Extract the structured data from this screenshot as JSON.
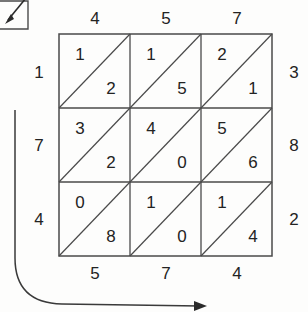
{
  "figure": {
    "type": "lattice-multiplication-grid",
    "rows": 3,
    "cols": 3,
    "diagonal_direction": "bottom-left-to-top-right",
    "line_color": "#4a4a4a",
    "text_color": "#232323",
    "background_color": "#fdfdfc"
  },
  "labels": {
    "top": [
      "4",
      "5",
      "7"
    ],
    "bottom": [
      "5",
      "7",
      "4"
    ],
    "left": [
      "1",
      "7",
      "4"
    ],
    "right": [
      "3",
      "8",
      "2"
    ]
  },
  "cells": [
    [
      {
        "upper": "1",
        "lower": "2"
      },
      {
        "upper": "1",
        "lower": "5"
      },
      {
        "upper": "2",
        "lower": "1"
      }
    ],
    [
      {
        "upper": "3",
        "lower": "2"
      },
      {
        "upper": "4",
        "lower": "0"
      },
      {
        "upper": "5",
        "lower": "6"
      }
    ],
    [
      {
        "upper": "0",
        "lower": "8"
      },
      {
        "upper": "1",
        "lower": "0"
      },
      {
        "upper": "1",
        "lower": "4"
      }
    ]
  ],
  "annotations": {
    "corner_box": {
      "name": "diagonal-arrow-box",
      "arrow_direction": "down-left"
    },
    "sweep_arrow": {
      "name": "curved-sweep-arrow",
      "direction": "down-then-right"
    }
  }
}
